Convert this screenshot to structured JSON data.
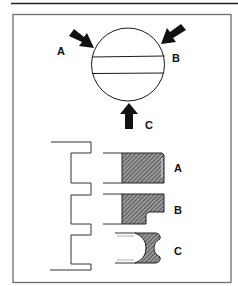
{
  "figure": {
    "type": "technical-diagram",
    "colors": {
      "line": "#1a1a1a",
      "frame": "#6e6e6e",
      "hatch": "#555555",
      "background": "#ffffff"
    },
    "top_view": {
      "arrows": [
        {
          "id": "A",
          "label": "A",
          "direction": "down-right"
        },
        {
          "id": "B",
          "label": "B",
          "direction": "down-left"
        },
        {
          "id": "C",
          "label": "C",
          "direction": "up"
        }
      ]
    },
    "profiles": [
      {
        "id": "A",
        "label": "A",
        "shape": "rectangular section"
      },
      {
        "id": "B",
        "label": "B",
        "shape": "stepped (L) section"
      },
      {
        "id": "C",
        "label": "C",
        "shape": "concave/grooved section"
      }
    ]
  }
}
